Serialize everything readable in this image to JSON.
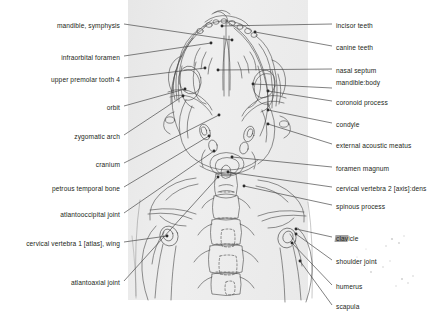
{
  "figure": {
    "panel_color": "#ebebeb",
    "ink_color": "#3a3a3a",
    "leader_color": "#4a4a4a"
  },
  "labels_left": [
    {
      "id": "mandible-symphysis",
      "lines": [
        "mandible, symphysis"
      ],
      "x": 120,
      "y": 22,
      "leader": [
        [
          124,
          24
        ],
        [
          232,
          40
        ]
      ]
    },
    {
      "id": "infraorbital-foramen",
      "lines": [
        "infraorbital foramen"
      ],
      "x": 120,
      "y": 54,
      "leader": [
        [
          124,
          56
        ],
        [
          211,
          43
        ]
      ]
    },
    {
      "id": "upper-premolar-tooth-4",
      "lines": [
        "upper premolar tooth 4"
      ],
      "x": 120,
      "y": 76,
      "leader": [
        [
          124,
          78
        ],
        [
          205,
          68
        ]
      ]
    },
    {
      "id": "orbit",
      "lines": [
        "orbit"
      ],
      "x": 120,
      "y": 104,
      "leader": [
        [
          124,
          106
        ],
        [
          185,
          89
        ]
      ]
    },
    {
      "id": "zygomatic-arch",
      "lines": [
        "zygomatic arch"
      ],
      "x": 120,
      "y": 133,
      "leader": [
        [
          124,
          135
        ],
        [
          183,
          96
        ]
      ]
    },
    {
      "id": "cranium",
      "lines": [
        "cranium"
      ],
      "x": 120,
      "y": 161,
      "leader": [
        [
          124,
          163
        ],
        [
          219,
          115
        ]
      ]
    },
    {
      "id": "petrous-temporal-bone",
      "lines": [
        "petrous temporal bone"
      ],
      "x": 120,
      "y": 185,
      "leader": [
        [
          124,
          187
        ],
        [
          209,
          136
        ]
      ]
    },
    {
      "id": "atlantooccipital-joint",
      "lines": [
        "atlantooccipital joint"
      ],
      "x": 120,
      "y": 211,
      "leader": [
        [
          124,
          213
        ],
        [
          214,
          151
        ]
      ]
    },
    {
      "id": "cervical-vertebra-1-atlas",
      "lines": [
        "cervical vertebra 1 [atlas], wing"
      ],
      "x": 120,
      "y": 240,
      "leader": [
        [
          124,
          242
        ],
        [
          167,
          236
        ]
      ]
    },
    {
      "id": "atlantoaxial-joint",
      "lines": [
        "atlantoaxial joint"
      ],
      "x": 120,
      "y": 279,
      "leader": [
        [
          124,
          281
        ],
        [
          218,
          177
        ]
      ]
    }
  ],
  "labels_right": [
    {
      "id": "incisor-teeth",
      "lines": [
        "incisor teeth"
      ],
      "x": 336,
      "y": 22,
      "leader": [
        [
          332,
          24
        ],
        [
          222,
          26
        ]
      ]
    },
    {
      "id": "canine-teeth",
      "lines": [
        "canine teeth"
      ],
      "x": 336,
      "y": 44,
      "leader": [
        [
          332,
          46
        ],
        [
          255,
          32
        ]
      ]
    },
    {
      "id": "nasal-septum",
      "lines": [
        "nasal septum"
      ],
      "x": 336,
      "y": 67,
      "leader": [
        [
          332,
          69
        ],
        [
          218,
          70
        ]
      ]
    },
    {
      "id": "mandible-body",
      "lines": [
        "mandible:",
        "body"
      ],
      "x": 336,
      "y": 79,
      "leader": [
        [
          332,
          88
        ],
        [
          253,
          84
        ]
      ]
    },
    {
      "id": "coronoid-process",
      "lines": [
        "coronoid process"
      ],
      "x": 336,
      "y": 99,
      "leader": [
        [
          332,
          101
        ],
        [
          268,
          91
        ]
      ]
    },
    {
      "id": "condyle",
      "lines": [
        "condyle"
      ],
      "x": 336,
      "y": 121,
      "leader": [
        [
          332,
          123
        ],
        [
          268,
          110
        ]
      ]
    },
    {
      "id": "external-acoustic-meatus",
      "lines": [
        "external acoustic meatus"
      ],
      "x": 336,
      "y": 142,
      "leader": [
        [
          332,
          144
        ],
        [
          268,
          124
        ]
      ]
    },
    {
      "id": "foramen-magnum",
      "lines": [
        "foramen magnum"
      ],
      "x": 336,
      "y": 165,
      "leader": [
        [
          332,
          167
        ],
        [
          232,
          157
        ]
      ]
    },
    {
      "id": "cervical-vertebra-2-axis",
      "lines": [
        "cervical vertebra 2 [axis]:",
        "dens"
      ],
      "x": 336,
      "y": 185,
      "leader": [
        [
          332,
          187
        ],
        [
          228,
          172
        ]
      ]
    },
    {
      "id": "spinous-process",
      "lines": [
        "spinous process"
      ],
      "x": 336,
      "y": 203,
      "leader": [
        [
          332,
          205
        ],
        [
          244,
          186
        ]
      ]
    },
    {
      "id": "clavicle",
      "lines": [
        "clavicle"
      ],
      "x": 336,
      "y": 235,
      "leader": [
        [
          332,
          237
        ],
        [
          296,
          229
        ]
      ],
      "smudged": true
    },
    {
      "id": "shoulder-joint",
      "lines": [
        "shoulder joint"
      ],
      "x": 336,
      "y": 258,
      "leader": [
        [
          332,
          260
        ],
        [
          296,
          234
        ]
      ]
    },
    {
      "id": "humerus",
      "lines": [
        "humerus"
      ],
      "x": 336,
      "y": 283,
      "leader": [
        [
          332,
          285
        ],
        [
          292,
          243
        ]
      ]
    },
    {
      "id": "scapula",
      "lines": [
        "scapula"
      ],
      "x": 336,
      "y": 303,
      "leader": [
        [
          332,
          305
        ],
        [
          300,
          261
        ]
      ]
    }
  ]
}
